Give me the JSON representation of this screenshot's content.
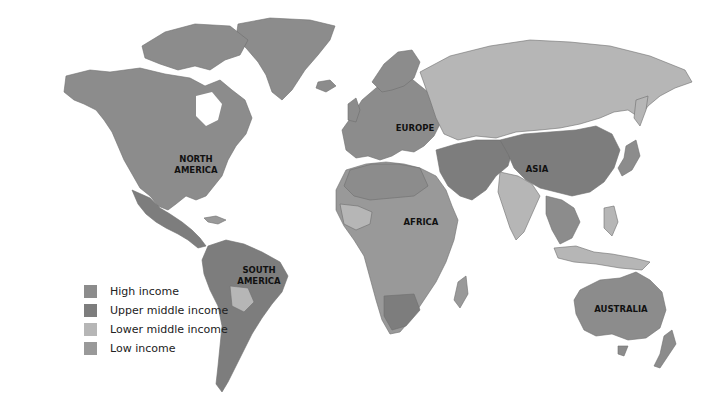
{
  "colors": {
    "high": "#8c8c8c",
    "upper_middle": "#7d7d7d",
    "lower_middle": "#b6b6b6",
    "low": "#999999",
    "water": "#ffffff"
  },
  "regions": {
    "north_america": "NORTH AMERICA",
    "north_america_l1": "NORTH",
    "north_america_l2": "AMERICA",
    "south_america_l1": "SOUTH",
    "south_america_l2": "AMERICA",
    "europe": "EUROPE",
    "africa": "AFRICA",
    "asia": "ASIA",
    "australia": "AUSTRALIA"
  },
  "legend": {
    "items": [
      {
        "label": "High income",
        "color": "#8c8c8c"
      },
      {
        "label": "Upper middle income",
        "color": "#7d7d7d"
      },
      {
        "label": "Lower middle income",
        "color": "#b6b6b6"
      },
      {
        "label": "Low income",
        "color": "#999999"
      }
    ]
  }
}
